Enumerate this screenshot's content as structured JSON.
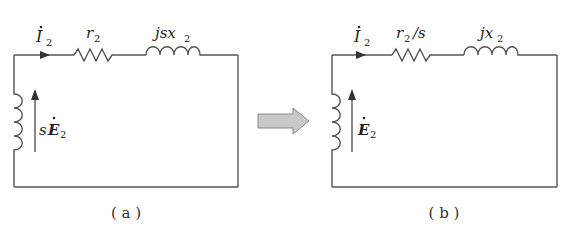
{
  "figure": {
    "panels": [
      {
        "id": "a",
        "caption": "( a )",
        "current_label": {
          "symbol": "I",
          "subscript": "2",
          "dot": true
        },
        "resistor_label": {
          "text": "r",
          "subscript": "2",
          "suffix": ""
        },
        "inductor_label": {
          "prefix": "jsx",
          "subscript": "2"
        },
        "emf_label": {
          "prefix": "s",
          "symbol": "E",
          "subscript": "2",
          "dot": true
        }
      },
      {
        "id": "b",
        "caption": "( b )",
        "current_label": {
          "symbol": "I",
          "subscript": "2",
          "dot": true
        },
        "resistor_label": {
          "text": "r",
          "subscript": "2",
          "suffix": "/s"
        },
        "inductor_label": {
          "prefix": "jx",
          "subscript": "2"
        },
        "emf_label": {
          "prefix": "",
          "symbol": "E",
          "subscript": "2",
          "dot": true
        }
      }
    ],
    "transition_arrow": {
      "fill": "#c8c8c8",
      "stroke": "#888888"
    },
    "colors": {
      "wire": "#555555",
      "text": "#222222",
      "background": "#ffffff"
    }
  }
}
